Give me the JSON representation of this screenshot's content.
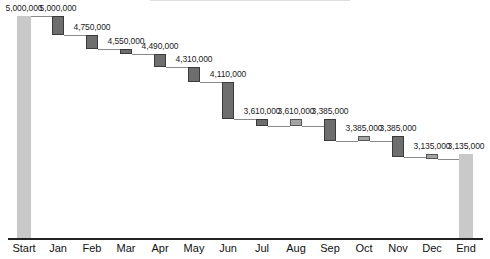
{
  "chart_data": {
    "type": "waterfall",
    "title": "",
    "xlabel": "",
    "ylabel": "",
    "ylim": [
      2000000,
      5000000
    ],
    "grid": false,
    "legend": null,
    "categories": [
      "Start",
      "Jan",
      "Feb",
      "Mar",
      "Apr",
      "May",
      "Jun",
      "Jul",
      "Aug",
      "Sep",
      "Oct",
      "Nov",
      "Dec",
      "End"
    ],
    "labels": [
      "5,000,000",
      "5,000,000",
      "4,750,000",
      "4,550,000",
      "4,490,000",
      "4,310,000",
      "4,110,000",
      "3,610,000",
      "3,610,000",
      "3,385,000",
      "3,385,000",
      "3,385,000",
      "3,135,000",
      "3,135,000"
    ],
    "bars": [
      {
        "category": "Start",
        "kind": "total",
        "from": 2000000,
        "to": 5000000
      },
      {
        "category": "Jan",
        "kind": "decrease",
        "from": 5000000,
        "to": 4750000
      },
      {
        "category": "Feb",
        "kind": "decrease",
        "from": 4750000,
        "to": 4550000
      },
      {
        "category": "Mar",
        "kind": "decrease",
        "from": 4550000,
        "to": 4490000
      },
      {
        "category": "Apr",
        "kind": "decrease",
        "from": 4490000,
        "to": 4310000
      },
      {
        "category": "May",
        "kind": "decrease",
        "from": 4310000,
        "to": 4110000
      },
      {
        "category": "Jun",
        "kind": "decrease",
        "from": 4110000,
        "to": 3610000
      },
      {
        "category": "Jul",
        "kind": "decrease",
        "from": 3610000,
        "to": 3515000
      },
      {
        "category": "Aug",
        "kind": "adjust",
        "from": 3610000,
        "to": 3515000
      },
      {
        "category": "Sep",
        "kind": "decrease",
        "from": 3610000,
        "to": 3315000
      },
      {
        "category": "Oct",
        "kind": "adjust",
        "from": 3385000,
        "to": 3315000
      },
      {
        "category": "Nov",
        "kind": "decrease",
        "from": 3385000,
        "to": 3095000
      },
      {
        "category": "Dec",
        "kind": "adjust",
        "from": 3135000,
        "to": 3070000
      },
      {
        "category": "End",
        "kind": "total",
        "from": 2000000,
        "to": 3135000
      }
    ],
    "colors": {
      "total": "#c9c9c9",
      "decrease": "#6e6e6e",
      "adjust": "#a3a3a3",
      "axis": "#222222",
      "connector": "#8a8a8a"
    }
  }
}
